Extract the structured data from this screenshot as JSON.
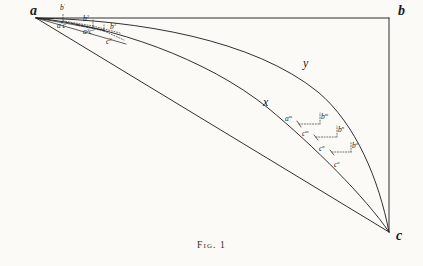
{
  "figure": {
    "caption": "Fig. 1",
    "background_color": "#fbfaf7",
    "ink_color": "#1a1a1a",
    "width": 423,
    "height": 266,
    "vertices": [
      {
        "name": "vertex-a",
        "label": "a",
        "x": 30,
        "y": 12
      },
      {
        "name": "vertex-b",
        "label": "b",
        "x": 401,
        "y": 14
      },
      {
        "name": "vertex-c",
        "label": "c",
        "x": 399,
        "y": 240
      }
    ],
    "curve_labels": [
      {
        "name": "curve-label-y",
        "label": "y",
        "x": 305,
        "y": 65
      },
      {
        "name": "curve-label-x",
        "label": "x",
        "x": 266,
        "y": 104
      }
    ],
    "node_labels": [
      {
        "name": "node-label-b-prime",
        "base": "b",
        "sup": "′",
        "x": 62,
        "y": 8
      },
      {
        "name": "node-label-a-prime-c-prime",
        "base": "a′c",
        "sup": "′",
        "x": 60,
        "y": 27
      },
      {
        "name": "node-label-b-2",
        "base": "b",
        "sup": "2",
        "x": 85,
        "y": 19
      },
      {
        "name": "node-label-a-2-c-2",
        "base": "a²c",
        "sup": "2",
        "x": 86,
        "y": 32
      },
      {
        "name": "node-label-b-3",
        "base": "b",
        "sup": "3",
        "x": 112,
        "y": 27
      },
      {
        "name": "node-label-c-3",
        "base": "c",
        "sup": "3",
        "x": 108,
        "y": 42
      },
      {
        "name": "node-label-a-m",
        "base": "a",
        "sup": "m",
        "x": 288,
        "y": 120
      },
      {
        "name": "node-label-b-m",
        "base": "b",
        "sup": "m",
        "x": 313,
        "y": 117
      },
      {
        "name": "node-label-c-m",
        "base": "c",
        "sup": "m",
        "x": 303,
        "y": 134
      },
      {
        "name": "node-label-b-n",
        "base": "b",
        "sup": "n",
        "x": 331,
        "y": 132
      },
      {
        "name": "node-label-c-n",
        "base": "c",
        "sup": "n",
        "x": 322,
        "y": 149
      },
      {
        "name": "node-label-b-o",
        "base": "b",
        "sup": "o",
        "x": 344,
        "y": 148
      },
      {
        "name": "node-label-c-o",
        "base": "c",
        "sup": "o",
        "x": 333,
        "y": 165
      }
    ],
    "geometry": {
      "a": [
        36,
        18
      ],
      "b": [
        389,
        18
      ],
      "c": [
        389,
        232
      ],
      "top_edge": "M36,18 L389,18",
      "right_edge": "M389,18 L389,232",
      "hypotenuse": "M36,18 L389,232",
      "curve_y": "M36,18 C150,22 268,44 330,96 C362,124 380,180 389,232",
      "curve_x": "M36,18 C120,26 216,62 276,112 C318,148 364,198 389,232",
      "chord_1": "M36,18 L389,18",
      "chord_2": "M36,18 L110,34",
      "chord_3": "M36,18 L128,48",
      "dotted_segments": [
        "M64,22 L64,16 M64,22 L96,28",
        "M96,28 L96,22 M96,28 L122,36",
        "M300,126 L318,126 M318,126 L318,114",
        "M318,137 L336,137 M336,137 L336,126",
        "M336,152 L352,152 M352,152 L352,141"
      ]
    }
  }
}
